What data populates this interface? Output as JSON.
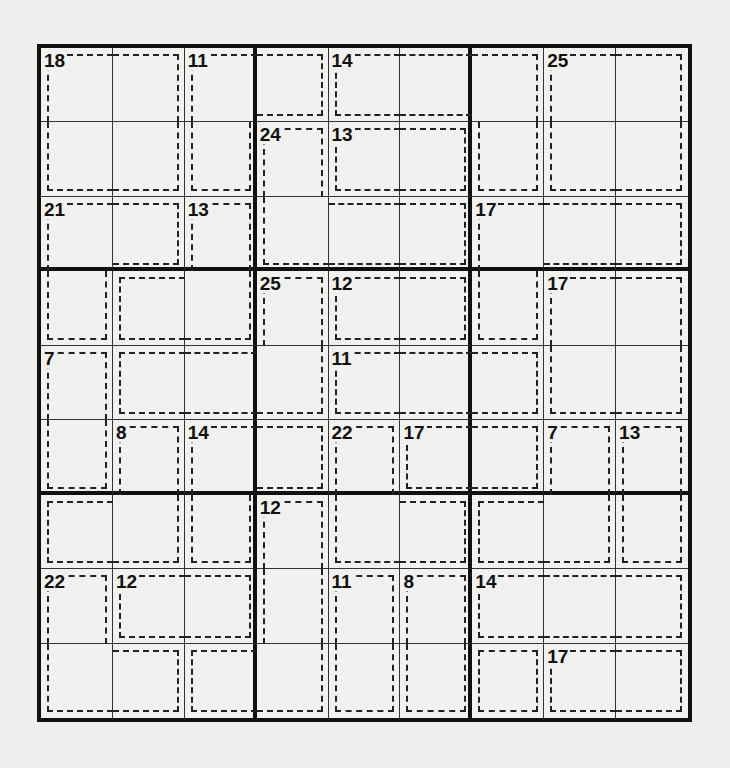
{
  "puzzle": {
    "type": "killer-sudoku",
    "size": 9,
    "cages": [
      {
        "sum": "18",
        "cells": [
          [
            0,
            0
          ],
          [
            0,
            1
          ],
          [
            1,
            0
          ],
          [
            1,
            1
          ]
        ]
      },
      {
        "sum": "11",
        "cells": [
          [
            0,
            2
          ],
          [
            1,
            2
          ],
          [
            0,
            3
          ]
        ]
      },
      {
        "sum": "14",
        "cells": [
          [
            0,
            4
          ],
          [
            0,
            5
          ],
          [
            0,
            6
          ],
          [
            1,
            6
          ]
        ]
      },
      {
        "sum": "25",
        "cells": [
          [
            0,
            7
          ],
          [
            0,
            8
          ],
          [
            1,
            7
          ],
          [
            1,
            8
          ]
        ]
      },
      {
        "sum": "24",
        "cells": [
          [
            1,
            3
          ],
          [
            2,
            3
          ],
          [
            2,
            4
          ],
          [
            2,
            5
          ]
        ]
      },
      {
        "sum": "13",
        "cells": [
          [
            1,
            4
          ],
          [
            1,
            5
          ]
        ]
      },
      {
        "sum": "21",
        "cells": [
          [
            2,
            0
          ],
          [
            2,
            1
          ],
          [
            3,
            0
          ]
        ]
      },
      {
        "sum": "13",
        "cells": [
          [
            2,
            2
          ],
          [
            3,
            1
          ],
          [
            3,
            2
          ]
        ]
      },
      {
        "sum": "17",
        "cells": [
          [
            2,
            6
          ],
          [
            2,
            7
          ],
          [
            2,
            8
          ],
          [
            3,
            6
          ]
        ]
      },
      {
        "sum": "25",
        "cells": [
          [
            3,
            3
          ],
          [
            4,
            1
          ],
          [
            4,
            2
          ],
          [
            4,
            3
          ]
        ]
      },
      {
        "sum": "12",
        "cells": [
          [
            3,
            4
          ],
          [
            3,
            5
          ]
        ]
      },
      {
        "sum": "17",
        "cells": [
          [
            3,
            7
          ],
          [
            3,
            8
          ],
          [
            4,
            7
          ],
          [
            4,
            8
          ]
        ]
      },
      {
        "sum": "7",
        "cells": [
          [
            4,
            0
          ],
          [
            5,
            0
          ]
        ]
      },
      {
        "sum": "11",
        "cells": [
          [
            4,
            4
          ],
          [
            4,
            5
          ],
          [
            4,
            6
          ]
        ]
      },
      {
        "sum": "8",
        "cells": [
          [
            5,
            1
          ],
          [
            6,
            0
          ],
          [
            6,
            1
          ]
        ]
      },
      {
        "sum": "14",
        "cells": [
          [
            5,
            2
          ],
          [
            5,
            3
          ],
          [
            6,
            2
          ]
        ]
      },
      {
        "sum": "22",
        "cells": [
          [
            5,
            4
          ],
          [
            6,
            4
          ],
          [
            6,
            5
          ]
        ]
      },
      {
        "sum": "17",
        "cells": [
          [
            5,
            5
          ],
          [
            5,
            6
          ]
        ]
      },
      {
        "sum": "7",
        "cells": [
          [
            5,
            7
          ],
          [
            6,
            6
          ],
          [
            6,
            7
          ]
        ]
      },
      {
        "sum": "13",
        "cells": [
          [
            5,
            8
          ],
          [
            6,
            8
          ]
        ]
      },
      {
        "sum": "12",
        "cells": [
          [
            6,
            3
          ],
          [
            7,
            3
          ],
          [
            8,
            3
          ],
          [
            8,
            2
          ]
        ]
      },
      {
        "sum": "22",
        "cells": [
          [
            7,
            0
          ],
          [
            8,
            0
          ],
          [
            8,
            1
          ]
        ]
      },
      {
        "sum": "12",
        "cells": [
          [
            7,
            1
          ],
          [
            7,
            2
          ]
        ]
      },
      {
        "sum": "11",
        "cells": [
          [
            7,
            4
          ],
          [
            8,
            4
          ]
        ]
      },
      {
        "sum": "8",
        "cells": [
          [
            7,
            5
          ],
          [
            8,
            5
          ]
        ]
      },
      {
        "sum": "14",
        "cells": [
          [
            7,
            6
          ],
          [
            7,
            7
          ],
          [
            7,
            8
          ]
        ]
      },
      {
        "sum": "17",
        "cells": [
          [
            8,
            7
          ],
          [
            8,
            8
          ]
        ]
      },
      {
        "sum": "",
        "cells": [
          [
            8,
            6
          ]
        ]
      }
    ]
  },
  "colors": {
    "grid": "#111111",
    "background": "#f1f1ef",
    "cage_dash": "#222222"
  }
}
